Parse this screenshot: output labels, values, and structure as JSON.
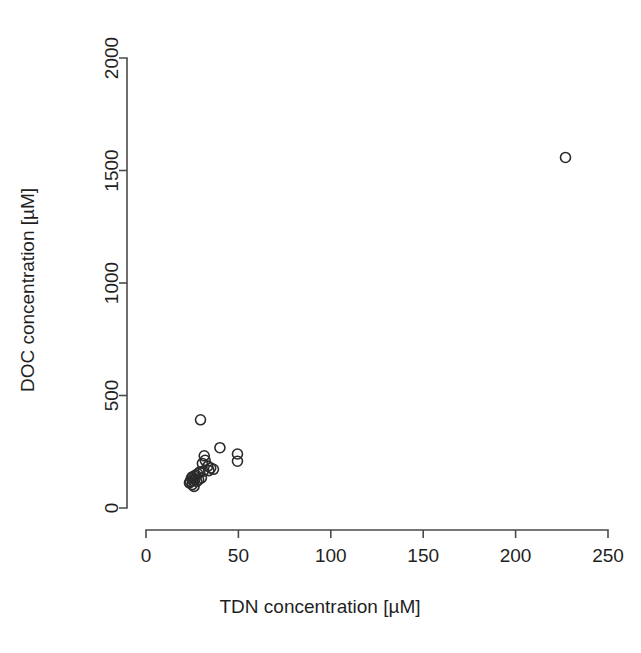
{
  "chart_data": {
    "type": "scatter",
    "title": "",
    "xlabel": "TDN concentration [µM]",
    "ylabel": "DOC concentration [µM]",
    "xlim": [
      0,
      250
    ],
    "ylim": [
      0,
      2000
    ],
    "xticks": [
      0,
      50,
      100,
      150,
      200,
      250
    ],
    "yticks": [
      0,
      500,
      1000,
      1500,
      2000
    ],
    "xtick_labels": [
      "0",
      "50",
      "100",
      "150",
      "200",
      "250"
    ],
    "ytick_labels": [
      "0",
      "500",
      "1000",
      "1500",
      "2000"
    ],
    "grid": false,
    "legend": null,
    "marker": "open-circle",
    "marker_color": "#2b2b2b",
    "marker_radius_px": 5,
    "points": [
      {
        "x": 29.5,
        "y": 392
      },
      {
        "x": 40.0,
        "y": 268
      },
      {
        "x": 49.5,
        "y": 240
      },
      {
        "x": 49.5,
        "y": 208
      },
      {
        "x": 31.5,
        "y": 232
      },
      {
        "x": 32.0,
        "y": 212
      },
      {
        "x": 30.5,
        "y": 198
      },
      {
        "x": 33.5,
        "y": 186
      },
      {
        "x": 35.0,
        "y": 178
      },
      {
        "x": 36.5,
        "y": 172
      },
      {
        "x": 34.0,
        "y": 166
      },
      {
        "x": 31.0,
        "y": 164
      },
      {
        "x": 29.0,
        "y": 160
      },
      {
        "x": 28.0,
        "y": 152
      },
      {
        "x": 27.0,
        "y": 146
      },
      {
        "x": 26.0,
        "y": 142
      },
      {
        "x": 25.0,
        "y": 138
      },
      {
        "x": 24.5,
        "y": 132
      },
      {
        "x": 26.5,
        "y": 128
      },
      {
        "x": 25.5,
        "y": 122
      },
      {
        "x": 24.0,
        "y": 118
      },
      {
        "x": 23.5,
        "y": 112
      },
      {
        "x": 27.5,
        "y": 118
      },
      {
        "x": 28.5,
        "y": 126
      },
      {
        "x": 30.0,
        "y": 134
      },
      {
        "x": 25.0,
        "y": 104
      },
      {
        "x": 26.0,
        "y": 96
      },
      {
        "x": 227.0,
        "y": 1558
      }
    ],
    "point_count": 28,
    "axis_color": "#4a4a4a",
    "background_color": "#ffffff"
  },
  "axes": {
    "x_axis_name": "x-axis",
    "y_axis_name": "y-axis"
  }
}
